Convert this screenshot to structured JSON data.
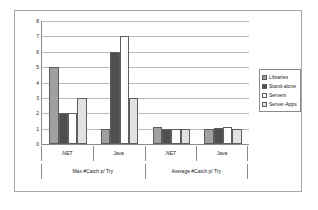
{
  "chart_data": {
    "type": "bar",
    "title": "",
    "xlabel": "",
    "ylabel": "",
    "ylim": [
      0,
      8
    ],
    "yticks": [
      0,
      1,
      2,
      3,
      4,
      5,
      6,
      7,
      8
    ],
    "grid": true,
    "legend_position": "right",
    "group_labels": [
      "Max #Catch p/ Try",
      "Average #Catch p/ Try"
    ],
    "categories": [
      ".NET",
      "Java",
      ".NET",
      "Java"
    ],
    "series": [
      {
        "name": "Libraries",
        "color": "#a0a0a0",
        "values": [
          5,
          1,
          1.1,
          0.95
        ]
      },
      {
        "name": "Stand-alone",
        "color": "#4f4f4f",
        "values": [
          2,
          6,
          1.0,
          1.05
        ]
      },
      {
        "name": "Servers",
        "color": "#ffffff",
        "values": [
          2,
          7,
          1.0,
          1.1
        ]
      },
      {
        "name": "Server-Apps",
        "color": "#e2e2e2",
        "values": [
          3,
          3,
          1.0,
          1.0
        ]
      }
    ]
  },
  "legend": {
    "items": [
      {
        "label": "Libraries"
      },
      {
        "label": "Stand-alone"
      },
      {
        "label": "Servers"
      },
      {
        "label": "Server-Apps"
      }
    ]
  }
}
